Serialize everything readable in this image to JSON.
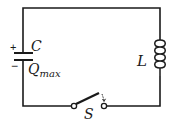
{
  "diagram": {
    "colors": {
      "wire": "#1a1a1a",
      "background": "#ffffff"
    },
    "components": {
      "capacitor": {
        "label": "C",
        "charge_label": "Q",
        "charge_subscript": "max",
        "plus_sign": "+",
        "minus_sign": "−"
      },
      "inductor": {
        "label": "L"
      },
      "switch": {
        "label": "S",
        "state": "open"
      }
    }
  }
}
